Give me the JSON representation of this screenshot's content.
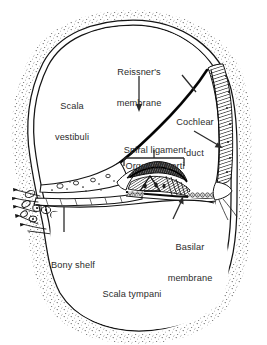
{
  "figure": {
    "subject": "cochlea",
    "background_color": "#ffffff",
    "ink_color": "#1a1a1a",
    "label_color": "#2b2b2b"
  },
  "labels": {
    "reissners_membrane": {
      "line1": "Reissner's",
      "line2": "membrane"
    },
    "scala_vestibuli": {
      "line1": "Scala",
      "line2": "vestibuli"
    },
    "cochlear_duct": {
      "line1": "Cochlear",
      "line2": "duct"
    },
    "spiral_ligament": {
      "line1": "Spiral ligament"
    },
    "organ_of_corti": {
      "line1": "Organ of Corti"
    },
    "basilar_membrane": {
      "line1": "Basilar",
      "line2": "membrane"
    },
    "bony_shelf": {
      "line1": "Bony shelf"
    },
    "scala_tympani": {
      "line1": "Scala tympani"
    }
  },
  "structures": [
    {
      "name": "scala-vestibuli",
      "kind": "chamber"
    },
    {
      "name": "cochlear-duct",
      "kind": "chamber"
    },
    {
      "name": "scala-tympani",
      "kind": "chamber"
    },
    {
      "name": "reissners-membrane",
      "kind": "membrane"
    },
    {
      "name": "basilar-membrane",
      "kind": "membrane"
    },
    {
      "name": "spiral-ligament",
      "kind": "tissue"
    },
    {
      "name": "organ-of-corti",
      "kind": "tissue"
    },
    {
      "name": "bony-shelf",
      "kind": "bone"
    },
    {
      "name": "spiral-ganglion",
      "kind": "nerve"
    },
    {
      "name": "otic-capsule-bone",
      "kind": "bone"
    }
  ],
  "leaders": [
    {
      "name": "reissners-membrane-arrow",
      "type": "arrow"
    },
    {
      "name": "cochlear-duct-leader",
      "type": "line"
    },
    {
      "name": "spiral-ligament-leader",
      "type": "arrow"
    },
    {
      "name": "organ-of-corti-bracket",
      "type": "bracket"
    },
    {
      "name": "basilar-membrane-arrow",
      "type": "arrow"
    },
    {
      "name": "bony-shelf-leader",
      "type": "line"
    }
  ]
}
